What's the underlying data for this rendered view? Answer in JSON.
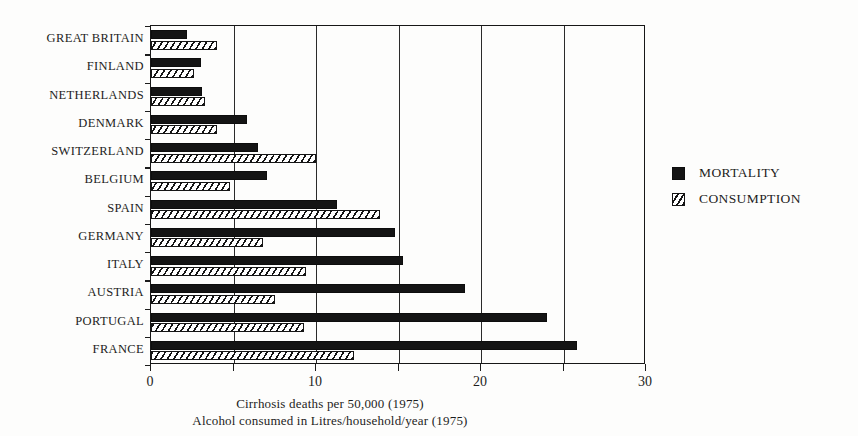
{
  "chart_data": {
    "type": "bar",
    "orientation": "horizontal",
    "title": "",
    "xlabel": "Cirrhosis deaths per 50,000 (1975)",
    "xlabel_2": "Alcohol consumed in Litres/household/year (1975)",
    "ylabel": "",
    "xlim": [
      0,
      30
    ],
    "xticks": [
      0,
      10,
      20,
      30
    ],
    "xticklabels": [
      "0",
      "10",
      "20",
      "30"
    ],
    "gridlines": [
      0,
      5,
      10,
      15,
      20,
      25,
      30
    ],
    "grid": true,
    "legend_position": "right",
    "categories": [
      "GREAT BRITAIN",
      "FINLAND",
      "NETHERLANDS",
      "DENMARK",
      "SWITZERLAND",
      "BELGIUM",
      "SPAIN",
      "GERMANY",
      "ITALY",
      "AUSTRIA",
      "PORTUGAL",
      "FRANCE"
    ],
    "series": [
      {
        "name": "MORTALITY",
        "style": "solid-black",
        "values": [
          2.2,
          3.0,
          3.1,
          5.8,
          6.5,
          7.0,
          11.3,
          14.8,
          15.3,
          19.0,
          24.0,
          25.8
        ]
      },
      {
        "name": "CONSUMPTION",
        "style": "diagonal-hatch",
        "values": [
          4.0,
          2.6,
          3.3,
          4.0,
          10.0,
          4.8,
          13.9,
          6.8,
          9.4,
          7.5,
          9.3,
          12.3
        ]
      }
    ]
  },
  "legend": {
    "items": [
      {
        "label": "MORTALITY"
      },
      {
        "label": "CONSUMPTION"
      }
    ]
  },
  "colors": {
    "ink": "#141414",
    "paper": "#fdfdfc",
    "grid": "#2a2a2a"
  }
}
